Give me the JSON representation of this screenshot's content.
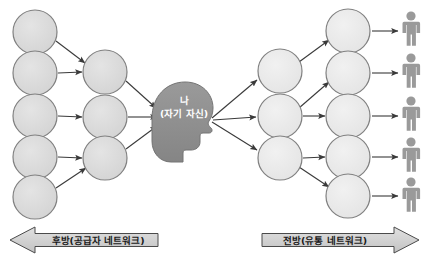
{
  "canvas": {
    "width": 429,
    "height": 271,
    "background": "#ffffff"
  },
  "colors": {
    "circle_fill": "#d9d9d9",
    "circle_fill_right": "#e8e8e8",
    "circle_stroke": "#808080",
    "head_fill": "#8f8f8f",
    "head_stroke": "#6f6f6f",
    "person_fill": "#9a9a9a",
    "arrow_stroke": "#3a3a3a",
    "banner_fill": "#d4d4d4",
    "banner_stroke": "#4a4a4a",
    "label_text": "#1a1a1a",
    "node_text": "#ffffff"
  },
  "center": {
    "name": "self-node",
    "line1": "나",
    "line2": "(자기 자신)"
  },
  "banners": {
    "left": {
      "label": "후방(공급자 네트워크)",
      "direction": "left"
    },
    "right": {
      "label": "전방(유통 네트워크)",
      "direction": "right"
    }
  },
  "upstream": {
    "outer_nodes": [
      {
        "id": "u-outer-1",
        "cx": 35,
        "cy": 32,
        "r": 22
      },
      {
        "id": "u-outer-2",
        "cx": 35,
        "cy": 73,
        "r": 22
      },
      {
        "id": "u-outer-3",
        "cx": 35,
        "cy": 116,
        "r": 22
      },
      {
        "id": "u-outer-4",
        "cx": 35,
        "cy": 157,
        "r": 22
      },
      {
        "id": "u-outer-5",
        "cx": 35,
        "cy": 197,
        "r": 22
      }
    ],
    "mid_nodes": [
      {
        "id": "u-mid-1",
        "cx": 105,
        "cy": 72,
        "r": 22
      },
      {
        "id": "u-mid-2",
        "cx": 105,
        "cy": 117,
        "r": 22
      },
      {
        "id": "u-mid-3",
        "cx": 105,
        "cy": 158,
        "r": 22
      }
    ],
    "edges": [
      {
        "from": "u-outer-1",
        "to": "u-mid-1"
      },
      {
        "from": "u-outer-2",
        "to": "u-mid-1"
      },
      {
        "from": "u-outer-3",
        "to": "u-mid-2"
      },
      {
        "from": "u-outer-4",
        "to": "u-mid-3"
      },
      {
        "from": "u-outer-5",
        "to": "u-mid-3"
      },
      {
        "from": "u-mid-1",
        "to": "self-node"
      },
      {
        "from": "u-mid-2",
        "to": "self-node"
      },
      {
        "from": "u-mid-3",
        "to": "self-node"
      }
    ]
  },
  "downstream": {
    "mid_nodes": [
      {
        "id": "d-mid-1",
        "cx": 280,
        "cy": 71,
        "r": 22
      },
      {
        "id": "d-mid-2",
        "cx": 280,
        "cy": 116,
        "r": 22
      },
      {
        "id": "d-mid-3",
        "cx": 280,
        "cy": 158,
        "r": 22
      }
    ],
    "outer_nodes": [
      {
        "id": "d-outer-1",
        "cx": 348,
        "cy": 31,
        "r": 22
      },
      {
        "id": "d-outer-2",
        "cx": 348,
        "cy": 73,
        "r": 22
      },
      {
        "id": "d-outer-3",
        "cx": 348,
        "cy": 116,
        "r": 22
      },
      {
        "id": "d-outer-4",
        "cx": 348,
        "cy": 157,
        "r": 22
      },
      {
        "id": "d-outer-5",
        "cx": 348,
        "cy": 196,
        "r": 22
      }
    ],
    "people": [
      {
        "id": "person-1",
        "x": 411,
        "y": 30
      },
      {
        "id": "person-2",
        "x": 411,
        "y": 72
      },
      {
        "id": "person-3",
        "x": 411,
        "y": 115
      },
      {
        "id": "person-4",
        "x": 411,
        "y": 156
      },
      {
        "id": "person-5",
        "x": 411,
        "y": 196
      }
    ],
    "edges": [
      {
        "from": "self-node",
        "to": "d-mid-1"
      },
      {
        "from": "self-node",
        "to": "d-mid-2"
      },
      {
        "from": "self-node",
        "to": "d-mid-3"
      },
      {
        "from": "d-mid-1",
        "to": "d-outer-1"
      },
      {
        "from": "d-mid-2",
        "to": "d-outer-2"
      },
      {
        "from": "d-mid-2",
        "to": "d-outer-3"
      },
      {
        "from": "d-mid-3",
        "to": "d-outer-4"
      },
      {
        "from": "d-mid-3",
        "to": "d-outer-5"
      },
      {
        "from": "d-outer-1",
        "to": "person-1"
      },
      {
        "from": "d-outer-2",
        "to": "person-2"
      },
      {
        "from": "d-outer-3",
        "to": "person-3"
      },
      {
        "from": "d-outer-4",
        "to": "person-4"
      },
      {
        "from": "d-outer-5",
        "to": "person-5"
      }
    ]
  }
}
